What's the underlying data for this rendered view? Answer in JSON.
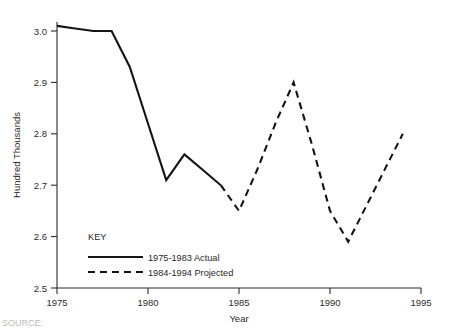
{
  "chart_data": {
    "type": "line",
    "title": "",
    "subtitle": "",
    "xlabel": "Year",
    "ylabel": "Hundred Thousands",
    "xlim": [
      1975,
      1995
    ],
    "ylim": [
      2.5,
      3.0
    ],
    "grid": false,
    "legend_position": "inside-bottom-left",
    "legend_title": "KEY",
    "x_ticks": [
      1975,
      1980,
      1985,
      1990,
      1995
    ],
    "x_tick_labels": [
      "1975",
      "1980",
      "1985",
      "1990",
      "1995"
    ],
    "y_ticks": [
      2.5,
      2.6,
      2.7,
      2.8,
      2.9,
      3.0
    ],
    "y_tick_labels": [
      "2.5",
      "2.6",
      "2.7",
      "2.8",
      "2.9",
      "3.0"
    ],
    "series": [
      {
        "name": "1975-1983 Actual",
        "style": "solid",
        "color": "#141414",
        "x": [
          1975,
          1976,
          1977,
          1978,
          1979,
          1980,
          1981,
          1982,
          1983,
          1984
        ],
        "values": [
          3.01,
          3.005,
          3.0,
          3.0,
          2.93,
          2.82,
          2.71,
          2.76,
          2.73,
          2.7
        ]
      },
      {
        "name": "1984-1994 Projected",
        "style": "dashed",
        "color": "#141414",
        "x": [
          1984,
          1985,
          1986,
          1987,
          1988,
          1989,
          1990,
          1991,
          1992,
          1993,
          1994
        ],
        "values": [
          2.7,
          2.65,
          2.73,
          2.82,
          2.9,
          2.78,
          2.65,
          2.59,
          2.66,
          2.73,
          2.8
        ]
      }
    ],
    "annotations": []
  },
  "legend": {
    "title": "KEY",
    "entries": [
      {
        "label": "1975-1983 Actual",
        "style": "solid"
      },
      {
        "label": "1984-1994 Projected",
        "style": "dashed"
      }
    ]
  },
  "axes": {
    "y_label": "Hundred Thousands",
    "x_label": "Year",
    "y_tick_0": "2.5",
    "y_tick_1": "2.6",
    "y_tick_2": "2.7",
    "y_tick_3": "2.8",
    "y_tick_4": "2.9",
    "y_tick_5": "3.0",
    "x_tick_0": "1975",
    "x_tick_1": "1980",
    "x_tick_2": "1985",
    "x_tick_3": "1990",
    "x_tick_4": "1995"
  },
  "footer": {
    "source_note": "SOURCE:"
  }
}
